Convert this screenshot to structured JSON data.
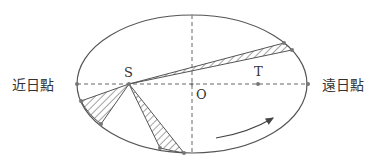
{
  "figure": {
    "labels": {
      "perihelion": "近日點",
      "aphelion": "遠日點",
      "sun": "S",
      "other_focus": "T",
      "center": "O"
    },
    "colors": {
      "stroke": "#555555",
      "text": "#333333",
      "dot": "#777777",
      "background": "#ffffff"
    },
    "ellipse": {
      "cx": 192,
      "cy": 84,
      "rx": 115,
      "ry": 69
    },
    "points": {
      "S": [
        129,
        84
      ],
      "T": [
        258,
        84
      ],
      "O": [
        192,
        84
      ],
      "perihelion": [
        77,
        84
      ],
      "aphelion": [
        308,
        84
      ]
    },
    "sectors": [
      {
        "name": "upper-right",
        "p1": [
          284,
          43
        ],
        "p2": [
          292,
          50
        ]
      },
      {
        "name": "lower-left",
        "p1": [
          81,
          101
        ],
        "p2": [
          101,
          124
        ]
      },
      {
        "name": "bottom",
        "p1": [
          160,
          148
        ],
        "p2": [
          184,
          153
        ]
      }
    ],
    "direction_arrow": "counterclockwise-motion"
  }
}
